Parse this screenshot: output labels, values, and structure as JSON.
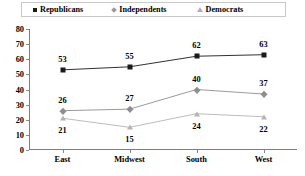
{
  "chart_data": {
    "type": "line",
    "title": "",
    "xlabel": "",
    "ylabel": "",
    "categories": [
      "East",
      "Midwest",
      "South",
      "West"
    ],
    "series": [
      {
        "name": "Republicans",
        "values": [
          53,
          55,
          62,
          63
        ],
        "marker": "square",
        "color": "#1a1a1a",
        "label_position": "above"
      },
      {
        "name": "Independents",
        "values": [
          26,
          27,
          40,
          37
        ],
        "marker": "diamond",
        "color": "#8e8e8e",
        "label_position": "above"
      },
      {
        "name": "Democrats",
        "values": [
          21,
          15,
          24,
          22
        ],
        "marker": "triangle",
        "color": "#b4b4b4",
        "label_position": "below"
      }
    ],
    "ylim": [
      0,
      80
    ],
    "yticks": [
      0,
      10,
      20,
      30,
      40,
      50,
      60,
      70,
      80
    ],
    "ytick_labels": [
      "0",
      "10",
      "20",
      "30",
      "40",
      "50",
      "60",
      "70",
      "80"
    ],
    "grid": false,
    "legend_position": "top"
  },
  "legend": {
    "items": [
      {
        "label": "Republicans",
        "marker_name": "square-marker-icon"
      },
      {
        "label": "Independents",
        "marker_name": "diamond-marker-icon"
      },
      {
        "label": "Democrats",
        "marker_name": "triangle-marker-icon"
      }
    ]
  },
  "colors": {
    "republicans": "#1a1a1a",
    "independents": "#8e8e8e",
    "democrats": "#b4b4b4",
    "axis": "#7d7d7d",
    "background": "#ffffff"
  }
}
